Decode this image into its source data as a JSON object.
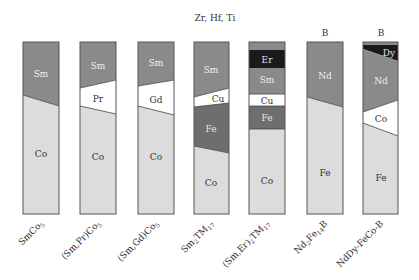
{
  "top_annotation": "Zr, Hf, Ti",
  "colors": {
    "dark_grey": "#8a8a8a",
    "light_grey": "#dcdcdc",
    "white": "#ffffff",
    "black": "#1a1a1a",
    "mid_grey": "#6e6e6e",
    "outline": "#555555"
  },
  "bars": [
    {
      "category": "SmCo5",
      "top_label": "",
      "segments": [
        {
          "element": "Sm"
        },
        {
          "element": "Co"
        }
      ]
    },
    {
      "category": "(Sm,Pr)Co5",
      "top_label": "",
      "segments": [
        {
          "element": "Sm"
        },
        {
          "element": "Pr"
        },
        {
          "element": "Co"
        }
      ]
    },
    {
      "category": "(Sm,Gd)Co5",
      "top_label": "",
      "segments": [
        {
          "element": "Sm"
        },
        {
          "element": "Gd"
        },
        {
          "element": "Co"
        }
      ]
    },
    {
      "category": "Sm2TM17",
      "top_label": "",
      "segments": [
        {
          "element": "Sm"
        },
        {
          "element": "Cu"
        },
        {
          "element": "Fe"
        },
        {
          "element": "Co"
        }
      ]
    },
    {
      "category": "(Sm,Er)2TM17",
      "top_label": "",
      "segments": [
        {
          "element": "Er"
        },
        {
          "element": "Sm"
        },
        {
          "element": "Cu"
        },
        {
          "element": "Fe"
        },
        {
          "element": "Co"
        }
      ]
    },
    {
      "category": "Nd2Fe14B",
      "top_label": "B",
      "segments": [
        {
          "element": "Nd"
        },
        {
          "element": "Fe"
        }
      ]
    },
    {
      "category": "NdDy-FeCo-B",
      "top_label": "B",
      "segments": [
        {
          "element": "Dy"
        },
        {
          "element": "Nd"
        },
        {
          "element": "Co"
        },
        {
          "element": "Fe"
        }
      ]
    }
  ],
  "category_labels": {
    "b0": {
      "main": "SmCo",
      "sub": "5",
      "tail": ""
    },
    "b1": {
      "main": "(Sm,Pr)Co",
      "sub": "5",
      "tail": ""
    },
    "b2": {
      "main": "(Sm,Gd)Co",
      "sub": "5",
      "tail": ""
    },
    "b3": {
      "main": "Sm",
      "sub": "2",
      "mid": "TM",
      "sub2": "17"
    },
    "b4": {
      "main": "(Sm,Er)",
      "sub": "2",
      "mid": "TM",
      "sub2": "17"
    },
    "b5": {
      "main": "Nd",
      "sub": "2",
      "mid": "Fe",
      "sub2": "14",
      "tail": "B"
    },
    "b6": {
      "main": "NdDy-FeCo-B"
    }
  }
}
